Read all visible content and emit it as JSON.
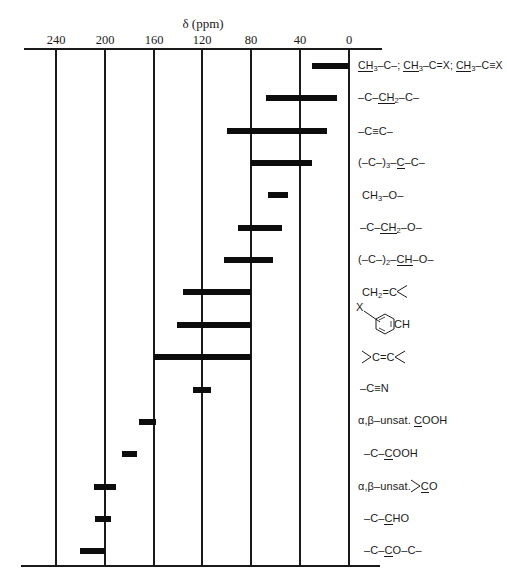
{
  "chart_data": {
    "type": "bar",
    "subtype": "horizontal-range",
    "title": "",
    "xlabel": "δ (ppm)",
    "ylabel": "",
    "x_axis": {
      "reversed": true,
      "range": [
        240,
        0
      ],
      "ticks": [
        240,
        200,
        160,
        120,
        80,
        40,
        0
      ],
      "tick_labels": [
        "240",
        "200",
        "160",
        "120",
        "80",
        "40",
        "0"
      ],
      "position": "top",
      "vertical_gridlines": true
    },
    "grid": true,
    "legend": null,
    "categories": [
      "CH3–C–; CH3–C=X; CH3–C≡X",
      "–C–CH2–C–",
      "–C≡C–",
      "(–C–)3–C–C–",
      "CH3–O–",
      "–C–CH2–O–",
      "(–C–)2–CH–O–",
      "CH2=C<",
      "X-substituted aromatic CH",
      ">C=C<",
      "–C≡N",
      "α,β–unsat. COOH",
      "–C–COOH",
      "α,β–unsat. >CO",
      "–C–CHO",
      "–C–CO–C–"
    ],
    "ranges": [
      {
        "low": 0,
        "high": 30
      },
      {
        "low": 10,
        "high": 68
      },
      {
        "low": 18,
        "high": 100
      },
      {
        "low": 30,
        "high": 80
      },
      {
        "low": 50,
        "high": 66
      },
      {
        "low": 55,
        "high": 91
      },
      {
        "low": 62,
        "high": 102
      },
      {
        "low": 80,
        "high": 136
      },
      {
        "low": 80,
        "high": 141
      },
      {
        "low": 80,
        "high": 160
      },
      {
        "low": 113,
        "high": 128
      },
      {
        "low": 158,
        "high": 172
      },
      {
        "low": 174,
        "high": 186
      },
      {
        "low": 191,
        "high": 209
      },
      {
        "low": 195,
        "high": 208
      },
      {
        "low": 200,
        "high": 220
      }
    ]
  },
  "axis": {
    "title": "δ (ppm)",
    "tick_labels": [
      "240",
      "200",
      "160",
      "120",
      "80",
      "40",
      "0"
    ]
  },
  "labels": {
    "r1": {
      "a": "CH",
      "a_sub": "3",
      "b": "–C–; ",
      "c": "CH",
      "c_sub": "3",
      "d": "–C=X; ",
      "e": "CH",
      "e_sub": "3",
      "f": "–C≡X"
    },
    "r2": {
      "a": "–C–",
      "b": "CH",
      "b_sub": "2",
      "c": "–C–"
    },
    "r3": {
      "a": "–C≡C–"
    },
    "r4": {
      "a": "(–C–)",
      "a_sub": "3",
      "b": "–",
      "c": "C",
      "d": "–C–"
    },
    "r5": {
      "a": "CH",
      "a_sub": "3",
      "b": "–O–"
    },
    "r6": {
      "a": "–C–",
      "b": "CH",
      "b_sub": "2",
      "c": "–O–"
    },
    "r7": {
      "a": "(–C–)",
      "a_sub": "2",
      "b": "–",
      "c": "CH",
      "d": "–O–"
    },
    "r8": {
      "a": "CH",
      "a_sub": "2",
      "b": "=C"
    },
    "r9": {
      "x": "X",
      "ch": "CH"
    },
    "r10": {
      "a": "C=C"
    },
    "r11": {
      "a": "–C≡N"
    },
    "r12": {
      "a": "α,β–unsat. ",
      "b": "C",
      "c": "OOH"
    },
    "r13": {
      "a": "–C–",
      "b": "C",
      "c": "OOH"
    },
    "r14": {
      "a": "α,β–unsat.",
      "b": "C",
      "c": "O"
    },
    "r15": {
      "a": "–C–",
      "b": "C",
      "c": "HO"
    },
    "r16": {
      "a": "–C–",
      "b": "C",
      "c": "O–C–"
    }
  }
}
